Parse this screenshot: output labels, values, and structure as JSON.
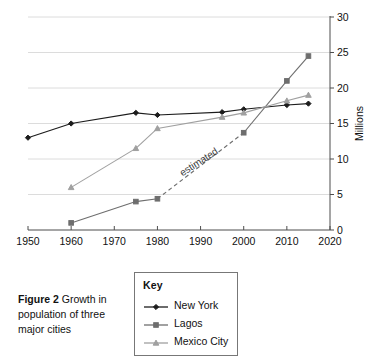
{
  "figure": {
    "caption_label": "Figure 2",
    "caption_text": " Growth in population of three major cities"
  },
  "legend": {
    "title": "Key",
    "entries": [
      {
        "label": "New York",
        "marker": "diamond-marker-icon",
        "color": "#1c1c1c"
      },
      {
        "label": "Lagos",
        "marker": "square-marker-icon",
        "color": "#6e6e6e"
      },
      {
        "label": "Mexico City",
        "marker": "triangle-marker-icon",
        "color": "#a0a0a0"
      }
    ]
  },
  "chart_data": {
    "type": "line",
    "title": "",
    "xlabel": "Year",
    "ylabel": "Millions",
    "xlim": [
      1950,
      2020
    ],
    "ylim": [
      0,
      30
    ],
    "xticks": [
      1950,
      1960,
      1970,
      1980,
      1990,
      2000,
      2010,
      2020
    ],
    "yticks": [
      0,
      5,
      10,
      15,
      20,
      25,
      30
    ],
    "xtick_labels": [
      "1950",
      "1960",
      "1970",
      "1980",
      "1990",
      "2000",
      "2010",
      "2020"
    ],
    "ytick_labels": [
      "0",
      "5",
      "10",
      "15",
      "20",
      "25",
      "30"
    ],
    "grid": "horizontal",
    "y_axis_position": "right",
    "legend_position": "below-outside",
    "annotations": [
      {
        "text": "estimated",
        "x": 1990,
        "y": 9.2,
        "rotation": -33,
        "series": "Lagos",
        "style": "dashed-segment-label"
      }
    ],
    "series": [
      {
        "name": "New York",
        "color": "#1c1c1c",
        "marker": "diamond",
        "x": [
          1950,
          1960,
          1975,
          1980,
          1995,
          2000,
          2010,
          2015
        ],
        "values": [
          13.0,
          15.0,
          16.5,
          16.2,
          16.6,
          17.0,
          17.6,
          17.8
        ]
      },
      {
        "name": "Lagos",
        "color": "#6e6e6e",
        "marker": "square",
        "x": [
          1960,
          1975,
          1980,
          2000,
          2010,
          2015
        ],
        "values": [
          1.0,
          4.0,
          4.4,
          13.7,
          21.0,
          24.5
        ],
        "dashed_from": 1980,
        "dashed_to": 2000
      },
      {
        "name": "Mexico City",
        "color": "#a0a0a0",
        "marker": "triangle",
        "x": [
          1960,
          1975,
          1980,
          1995,
          2000,
          2010,
          2015
        ],
        "values": [
          6.0,
          11.5,
          14.3,
          15.9,
          16.5,
          18.2,
          19.0
        ]
      }
    ]
  }
}
